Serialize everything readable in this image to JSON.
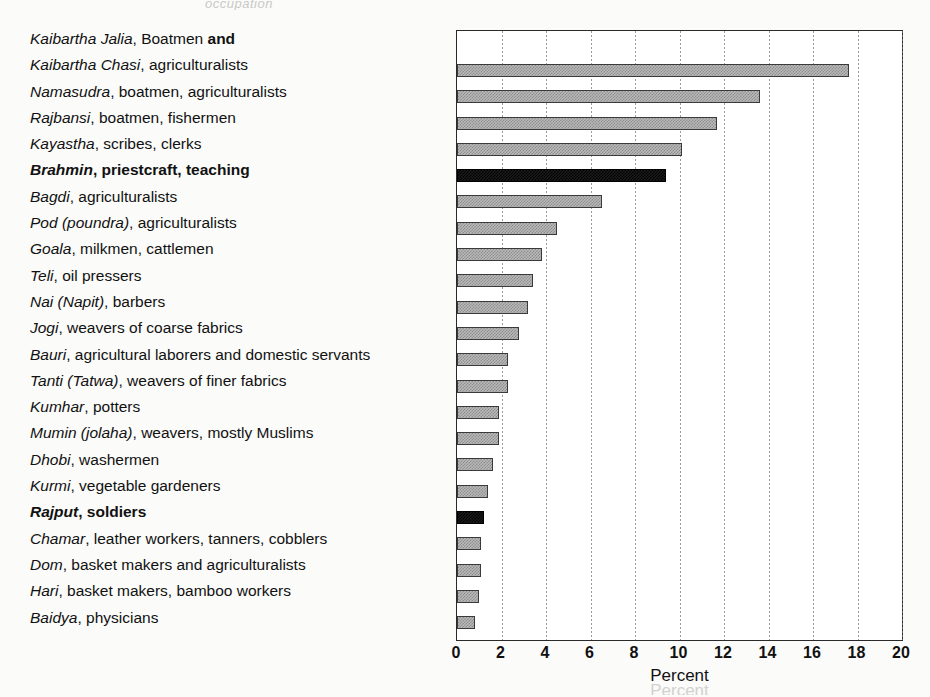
{
  "figure": {
    "scan_fragment_top": "occupation",
    "scan_fragment_bottom": "Percent"
  },
  "chart_data": {
    "type": "bar",
    "orientation": "horizontal",
    "title": "",
    "xlabel": "Percent",
    "ylabel": "",
    "xlim": [
      0,
      20
    ],
    "xticks": [
      0,
      2,
      4,
      6,
      8,
      10,
      12,
      14,
      16,
      18,
      20
    ],
    "grid": true,
    "legend": "none",
    "colors": {
      "default_bar": "#b9b9b9",
      "highlight_bar": "#1b1b1b",
      "axis": "#2a2a2a"
    },
    "categories": [
      "Kaibartha Jalia, Boatmen and Kaibartha Chasi, agriculturalists",
      "Namasudra, boatmen, agriculturalists",
      "Rajbansi, boatmen, fishermen",
      "Kayastha, scribes, clerks",
      "Brahmin, priestcraft, teaching",
      "Bagdi, agriculturalists",
      "Pod (poundra), agriculturalists",
      "Goala, milkmen, cattlemen",
      "Teli, oil pressers",
      "Nai (Napit), barbers",
      "Jogi, weavers of coarse fabrics",
      "Bauri, agricultural laborers and domestic servants",
      "Tanti (Tatwa), weavers of finer fabrics",
      "Kumhar, potters",
      "Mumin (jolaha), weavers, mostly Muslims",
      "Dhobi, washermen",
      "Kurmi, vegetable gardeners",
      "Rajput, soldiers",
      "Chamar, leather workers, tanners, cobblers",
      "Dom, basket makers and agriculturalists",
      "Hari, basket makers, bamboo workers",
      "Baidya, physicians"
    ],
    "values": [
      17.6,
      13.6,
      11.7,
      10.1,
      9.4,
      6.5,
      4.5,
      3.8,
      3.4,
      3.2,
      2.8,
      2.3,
      2.3,
      1.9,
      1.9,
      1.6,
      1.4,
      1.2,
      1.1,
      1.1,
      1.0,
      0.8
    ],
    "rows": [
      {
        "caste": "Kaibartha Jalia",
        "occupation": ", Boatmen ",
        "tail": "and",
        "value": null,
        "bold": false,
        "highlight": false,
        "continuation": false
      },
      {
        "caste": "Kaibartha Chasi",
        "occupation": ", agriculturalists",
        "tail": "",
        "value": 17.6,
        "bold": false,
        "highlight": false,
        "continuation": true
      },
      {
        "caste": "Namasudra",
        "occupation": ", boatmen, agriculturalists",
        "tail": "",
        "value": 13.6,
        "bold": false,
        "highlight": false,
        "continuation": false
      },
      {
        "caste": "Rajbansi",
        "occupation": ", boatmen, fishermen",
        "tail": "",
        "value": 11.7,
        "bold": false,
        "highlight": false,
        "continuation": false
      },
      {
        "caste": "Kayastha",
        "occupation": ", scribes, clerks",
        "tail": "",
        "value": 10.1,
        "bold": false,
        "highlight": false,
        "continuation": false
      },
      {
        "caste": "Brahmin",
        "occupation": ", priestcraft, teaching",
        "tail": "",
        "value": 9.4,
        "bold": true,
        "highlight": true,
        "continuation": false
      },
      {
        "caste": "Bagdi",
        "occupation": ", agriculturalists",
        "tail": "",
        "value": 6.5,
        "bold": false,
        "highlight": false,
        "continuation": false
      },
      {
        "caste": "Pod (poundra)",
        "occupation": ", agriculturalists",
        "tail": "",
        "value": 4.5,
        "bold": false,
        "highlight": false,
        "continuation": false
      },
      {
        "caste": "Goala",
        "occupation": ", milkmen, cattlemen",
        "tail": "",
        "value": 3.8,
        "bold": false,
        "highlight": false,
        "continuation": false
      },
      {
        "caste": "Teli",
        "occupation": ", oil pressers",
        "tail": "",
        "value": 3.4,
        "bold": false,
        "highlight": false,
        "continuation": false
      },
      {
        "caste": "Nai (Napit)",
        "occupation": ", barbers",
        "tail": "",
        "value": 3.2,
        "bold": false,
        "highlight": false,
        "continuation": false
      },
      {
        "caste": "Jogi",
        "occupation": ", weavers of coarse fabrics",
        "tail": "",
        "value": 2.8,
        "bold": false,
        "highlight": false,
        "continuation": false
      },
      {
        "caste": "Bauri",
        "occupation": ", agricultural laborers and domestic servants",
        "tail": "",
        "value": 2.3,
        "bold": false,
        "highlight": false,
        "continuation": false
      },
      {
        "caste": "Tanti (Tatwa)",
        "occupation": ", weavers of finer fabrics",
        "tail": "",
        "value": 2.3,
        "bold": false,
        "highlight": false,
        "continuation": false
      },
      {
        "caste": "Kumhar",
        "occupation": ", potters",
        "tail": "",
        "value": 1.9,
        "bold": false,
        "highlight": false,
        "continuation": false
      },
      {
        "caste": "Mumin (jolaha)",
        "occupation": ", weavers, mostly Muslims",
        "tail": "",
        "value": 1.9,
        "bold": false,
        "highlight": false,
        "continuation": false
      },
      {
        "caste": "Dhobi",
        "occupation": ", washermen",
        "tail": "",
        "value": 1.6,
        "bold": false,
        "highlight": false,
        "continuation": false
      },
      {
        "caste": "Kurmi",
        "occupation": ", vegetable gardeners",
        "tail": "",
        "value": 1.4,
        "bold": false,
        "highlight": false,
        "continuation": false
      },
      {
        "caste": "Rajput",
        "occupation": ", soldiers",
        "tail": "",
        "value": 1.2,
        "bold": true,
        "highlight": true,
        "continuation": false
      },
      {
        "caste": "Chamar",
        "occupation": ", leather workers, tanners, cobblers",
        "tail": "",
        "value": 1.1,
        "bold": false,
        "highlight": false,
        "continuation": false
      },
      {
        "caste": "Dom",
        "occupation": ", basket makers and agriculturalists",
        "tail": "",
        "value": 1.1,
        "bold": false,
        "highlight": false,
        "continuation": false
      },
      {
        "caste": "Hari",
        "occupation": ", basket makers, bamboo workers",
        "tail": "",
        "value": 1.0,
        "bold": false,
        "highlight": false,
        "continuation": false
      },
      {
        "caste": "Baidya",
        "occupation": ", physicians",
        "tail": "",
        "value": 0.8,
        "bold": false,
        "highlight": false,
        "continuation": false
      }
    ]
  }
}
